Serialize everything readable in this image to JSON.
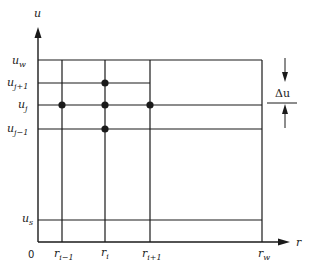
{
  "diagram": {
    "type": "finite-difference grid",
    "axes": {
      "vertical": {
        "label": "u"
      },
      "horizontal": {
        "label": "r"
      },
      "origin_label": "0"
    },
    "u_levels": [
      {
        "base": "u",
        "sub": "w"
      },
      {
        "base": "u",
        "sub": "j+1"
      },
      {
        "base": "u",
        "sub": "j"
      },
      {
        "base": "u",
        "sub": "j−1"
      },
      {
        "base": "u",
        "sub": "s"
      }
    ],
    "r_levels": [
      {
        "base": "r",
        "sub": "i−1"
      },
      {
        "base": "r",
        "sub": "i"
      },
      {
        "base": "r",
        "sub": "i+1"
      },
      {
        "base": "r",
        "sub": "w"
      }
    ],
    "increment_label": "Δu",
    "nodes": [
      "(r_i, u_j+1)",
      "(r_i-1, u_j)",
      "(r_i, u_j)",
      "(r_i+1, u_j)",
      "(r_i, u_j-1)"
    ],
    "colors": {
      "line": "#1a1a1a",
      "background": "#ffffff"
    }
  }
}
